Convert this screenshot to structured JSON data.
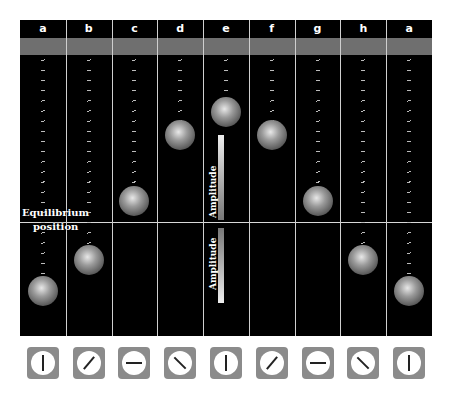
{
  "columns": [
    {
      "label": "a",
      "ball_top": 276,
      "spring_top": 35,
      "dial_angle": 0
    },
    {
      "label": "b",
      "ball_top": 245,
      "spring_top": 35,
      "dial_angle": 40
    },
    {
      "label": "c",
      "ball_top": 186,
      "spring_top": 35,
      "dial_angle": 90
    },
    {
      "label": "d",
      "ball_top": 120,
      "spring_top": 35,
      "dial_angle": 135
    },
    {
      "label": "e",
      "ball_top": 97,
      "spring_top": 35,
      "dial_angle": 180
    },
    {
      "label": "f",
      "ball_top": 120,
      "spring_top": 35,
      "dial_angle": 220
    },
    {
      "label": "g",
      "ball_top": 186,
      "spring_top": 35,
      "dial_angle": 270
    },
    {
      "label": "h",
      "ball_top": 245,
      "spring_top": 35,
      "dial_angle": 315
    },
    {
      "label": "a",
      "ball_top": 276,
      "spring_top": 35,
      "dial_angle": 360
    }
  ],
  "labels": {
    "equilibrium_line1": "Equilibrium",
    "equilibrium_line2": "position",
    "amplitude_up": "Amplitude",
    "amplitude_down": "Amplitude"
  },
  "colors": {
    "background": "#000000",
    "band": "#6f6f6f",
    "dial_frame": "#8b8b8b"
  }
}
